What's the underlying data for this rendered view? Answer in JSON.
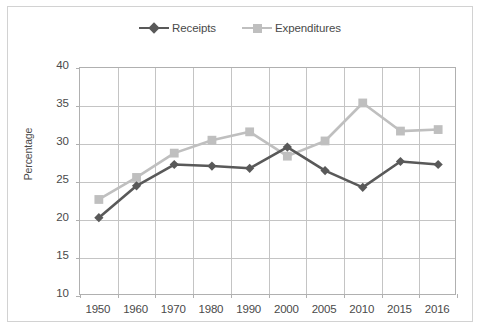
{
  "chart_data": {
    "type": "line",
    "title": "",
    "xlabel": "",
    "ylabel": "Percentage",
    "categories": [
      "1950",
      "1960",
      "1970",
      "1980",
      "1990",
      "2000",
      "2005",
      "2010",
      "2015",
      "2016"
    ],
    "ylim": [
      10,
      40
    ],
    "ytick_step": 5,
    "yticks": [
      "40",
      "35",
      "30",
      "25",
      "20",
      "15",
      "10"
    ],
    "grid": "both",
    "legend_position": "top-center",
    "series": [
      {
        "name": "Receipts",
        "color": "#595959",
        "marker": "diamond",
        "values": [
          20.3,
          24.5,
          27.3,
          27.1,
          26.8,
          29.6,
          26.5,
          24.3,
          27.7,
          27.3
        ]
      },
      {
        "name": "Expenditures",
        "color": "#bfbfbf",
        "marker": "square",
        "values": [
          22.7,
          25.6,
          28.8,
          30.5,
          31.6,
          28.4,
          30.4,
          35.4,
          31.7,
          31.9
        ]
      }
    ]
  },
  "style": {
    "border_color": "#d2d2d2",
    "axis_color": "#b0b0b0",
    "grid_color": "#c4c4c4",
    "text_color": "#4a4a4a",
    "background": "#ffffff"
  }
}
